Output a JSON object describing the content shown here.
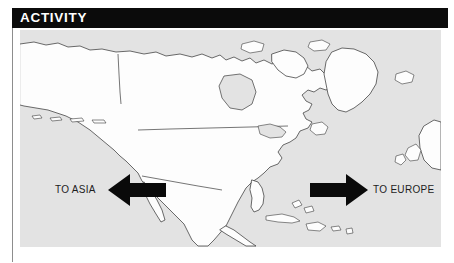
{
  "header": {
    "title": "ACTIVITY",
    "background_color": "#0b0b0b",
    "text_color": "#ffffff"
  },
  "map": {
    "name": "north-america-map",
    "ocean_color": "#e3e3e3",
    "land_color": "#fdfdfd",
    "outline_color": "#3b3b3b",
    "region": "North America, Greenland, Caribbean, North Atlantic and North Pacific"
  },
  "arrows": {
    "left": {
      "icon": "arrow-left-icon",
      "label": "TO ASIA",
      "color": "#0a0a0a",
      "direction": "left"
    },
    "right": {
      "icon": "arrow-right-icon",
      "label": "TO EUROPE",
      "color": "#0a0a0a",
      "direction": "right"
    }
  }
}
